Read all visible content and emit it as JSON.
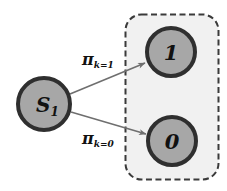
{
  "diagram": {
    "colors": {
      "background": "#ffffff",
      "node_fill": "#a7a7a7",
      "node_border": "#2f2f2f",
      "plate_fill": "#f1f1f1",
      "plate_border": "#3a3a3a",
      "arrow": "#6f6f6f",
      "text": "#111111"
    },
    "source_node": {
      "label_main": "S",
      "label_sub": "1"
    },
    "outcome_nodes": [
      {
        "label": "1"
      },
      {
        "label": "0"
      }
    ],
    "edges": [
      {
        "symbol": "π",
        "subscript": "k=1"
      },
      {
        "symbol": "π",
        "subscript": "k=0"
      }
    ]
  }
}
